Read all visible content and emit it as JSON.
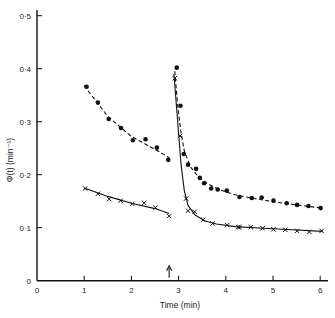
{
  "chart_data": {
    "type": "scatter",
    "title": "",
    "xlabel": "Time (min)",
    "ylabel": "Φ(t) (min⁻¹)",
    "xlim": [
      0,
      6
    ],
    "ylim": [
      0,
      0.5
    ],
    "xticks": [
      0,
      1,
      2,
      3,
      4,
      5,
      6
    ],
    "xtick_labels": [
      "0",
      "1",
      "2",
      "3",
      "4",
      "5",
      "6"
    ],
    "yticks": [
      0,
      0.1,
      0.2,
      0.3,
      0.4,
      0.5
    ],
    "ytick_labels": [
      "0",
      "0·1",
      "0·2",
      "0·3",
      "0·4",
      "0·5"
    ],
    "grid": false,
    "legend": null,
    "annotations": [
      {
        "type": "arrow",
        "x": 2.8,
        "direction": "up",
        "note": "marks time of change, ~2.8 min"
      }
    ],
    "series": [
      {
        "name": "dots (before, dashed fit)",
        "marker": "dot",
        "line": "dashed",
        "x": [
          1.05,
          1.29,
          1.52,
          1.78,
          2.03,
          2.3,
          2.54,
          2.78
        ],
        "y": [
          0.366,
          0.336,
          0.305,
          0.288,
          0.265,
          0.267,
          0.251,
          0.228
        ],
        "fit": [
          [
            1.0,
            0.368
          ],
          [
            1.5,
            0.31
          ],
          [
            2.0,
            0.272
          ],
          [
            2.5,
            0.248
          ],
          [
            2.8,
            0.232
          ]
        ]
      },
      {
        "name": "crosses (before, solid fit)",
        "marker": "cross",
        "line": "solid",
        "x": [
          1.02,
          1.29,
          1.53,
          1.77,
          2.02,
          2.27,
          2.51,
          2.8
        ],
        "y": [
          0.174,
          0.164,
          0.154,
          0.151,
          0.145,
          0.147,
          0.138,
          0.122
        ],
        "fit": [
          [
            1.0,
            0.175
          ],
          [
            1.5,
            0.159
          ],
          [
            2.0,
            0.146
          ],
          [
            2.5,
            0.136
          ],
          [
            2.8,
            0.127
          ]
        ]
      },
      {
        "name": "dots (after, dashed fit)",
        "marker": "dot",
        "line": "dashed",
        "x": [
          2.96,
          3.04,
          3.11,
          3.2,
          3.37,
          3.45,
          3.54,
          3.69,
          3.83,
          4.02,
          4.29,
          4.55,
          4.76,
          5.01,
          5.29,
          5.51,
          5.75,
          6.01
        ],
        "y": [
          0.402,
          0.33,
          0.239,
          0.219,
          0.211,
          0.194,
          0.184,
          0.174,
          0.172,
          0.17,
          0.158,
          0.156,
          0.157,
          0.151,
          0.146,
          0.143,
          0.141,
          0.137
        ],
        "fit": [
          [
            2.92,
            0.395
          ],
          [
            2.98,
            0.33
          ],
          [
            3.05,
            0.28
          ],
          [
            3.12,
            0.245
          ],
          [
            3.25,
            0.215
          ],
          [
            3.4,
            0.198
          ],
          [
            3.6,
            0.184
          ],
          [
            3.85,
            0.172
          ],
          [
            4.2,
            0.162
          ],
          [
            4.6,
            0.155
          ],
          [
            5.0,
            0.149
          ],
          [
            5.5,
            0.143
          ],
          [
            6.05,
            0.137
          ]
        ]
      },
      {
        "name": "crosses (after, solid fit)",
        "marker": "cross",
        "line": "solid",
        "x": [
          2.92,
          3.03,
          3.16,
          3.2,
          3.34,
          3.52,
          3.72,
          4.03,
          4.26,
          4.29,
          4.53,
          4.78,
          5.01,
          5.26,
          5.51,
          5.77,
          6.03
        ],
        "y": [
          0.382,
          0.273,
          0.155,
          0.132,
          0.13,
          0.115,
          0.108,
          0.105,
          0.101,
          0.101,
          0.101,
          0.099,
          0.097,
          0.096,
          0.094,
          0.092,
          0.094
        ],
        "fit": [
          [
            2.9,
            0.39
          ],
          [
            2.98,
            0.3
          ],
          [
            3.05,
            0.22
          ],
          [
            3.12,
            0.17
          ],
          [
            3.2,
            0.142
          ],
          [
            3.35,
            0.124
          ],
          [
            3.55,
            0.113
          ],
          [
            3.8,
            0.107
          ],
          [
            4.2,
            0.102
          ],
          [
            4.8,
            0.099
          ],
          [
            5.4,
            0.096
          ],
          [
            6.05,
            0.093
          ]
        ]
      }
    ]
  },
  "axes": {
    "x_title": "Time (min)",
    "y_title": "Φ(t) (min⁻¹)"
  }
}
